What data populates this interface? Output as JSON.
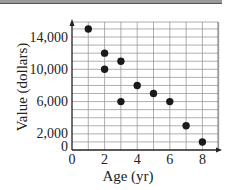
{
  "chart_data": {
    "type": "scatter",
    "title": "",
    "xlabel": "Age (yr)",
    "ylabel": "Value (dollars)",
    "xlim": [
      0,
      9
    ],
    "ylim": [
      0,
      16000
    ],
    "grid": true,
    "x_ticks": [
      "0",
      "2",
      "4",
      "6",
      "8"
    ],
    "y_ticks": [
      "0",
      "2,000",
      "6,000",
      "10,000",
      "14,000"
    ],
    "points": [
      {
        "x": 1,
        "y": 15000
      },
      {
        "x": 2,
        "y": 12000
      },
      {
        "x": 2,
        "y": 10000
      },
      {
        "x": 3,
        "y": 11000
      },
      {
        "x": 3,
        "y": 6000
      },
      {
        "x": 4,
        "y": 8000
      },
      {
        "x": 5,
        "y": 7000
      },
      {
        "x": 6,
        "y": 6000
      },
      {
        "x": 7,
        "y": 3000
      },
      {
        "x": 8,
        "y": 1000
      }
    ],
    "legend": null
  }
}
